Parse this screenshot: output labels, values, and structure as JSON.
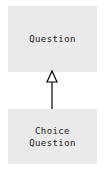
{
  "diagram": {
    "type": "uml-class-diagram",
    "canvas": {
      "width": 104,
      "height": 171,
      "background": "#ffffff"
    },
    "palette": {
      "class_fill": "#e9e9e9",
      "text_color": "#1a1a1a",
      "line_color": "#000000",
      "arrow_fill": "#ffffff"
    },
    "classes": [
      {
        "id": "question",
        "name": "Question",
        "name_lines": [
          "Question"
        ],
        "x": 8,
        "y": 6,
        "width": 89,
        "height": 66
      },
      {
        "id": "choice-question",
        "name": "Choice Question",
        "name_lines": [
          "Choice",
          "Question"
        ],
        "x": 8,
        "y": 109,
        "width": 89,
        "height": 55
      }
    ],
    "relationships": [
      {
        "id": "choice-question-generalizes-question",
        "kind": "generalization",
        "label": "",
        "source": "choice-question",
        "target": "question",
        "arrowhead": "hollow-triangle"
      }
    ]
  }
}
